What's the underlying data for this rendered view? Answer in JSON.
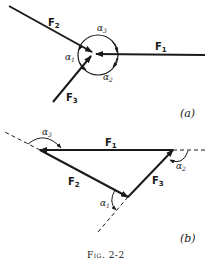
{
  "figure": {
    "caption": "Fig. 2-2",
    "panel_a": {
      "label": "(a)",
      "forces": [
        {
          "name": "F",
          "sub": "1"
        },
        {
          "name": "F",
          "sub": "2"
        },
        {
          "name": "F",
          "sub": "3"
        }
      ],
      "angles": [
        {
          "name": "α",
          "sub": "1"
        },
        {
          "name": "α",
          "sub": "2"
        },
        {
          "name": "α",
          "sub": "3"
        }
      ]
    },
    "panel_b": {
      "label": "(b)",
      "forces": [
        {
          "name": "F",
          "sub": "1"
        },
        {
          "name": "F",
          "sub": "2"
        },
        {
          "name": "F",
          "sub": "3"
        }
      ],
      "angles": [
        {
          "name": "α",
          "sub": "1"
        },
        {
          "name": "α",
          "sub": "2"
        },
        {
          "name": "α",
          "sub": "3"
        }
      ]
    }
  },
  "colors": {
    "ink": "#1a1a1a",
    "background": "#ffffff"
  }
}
